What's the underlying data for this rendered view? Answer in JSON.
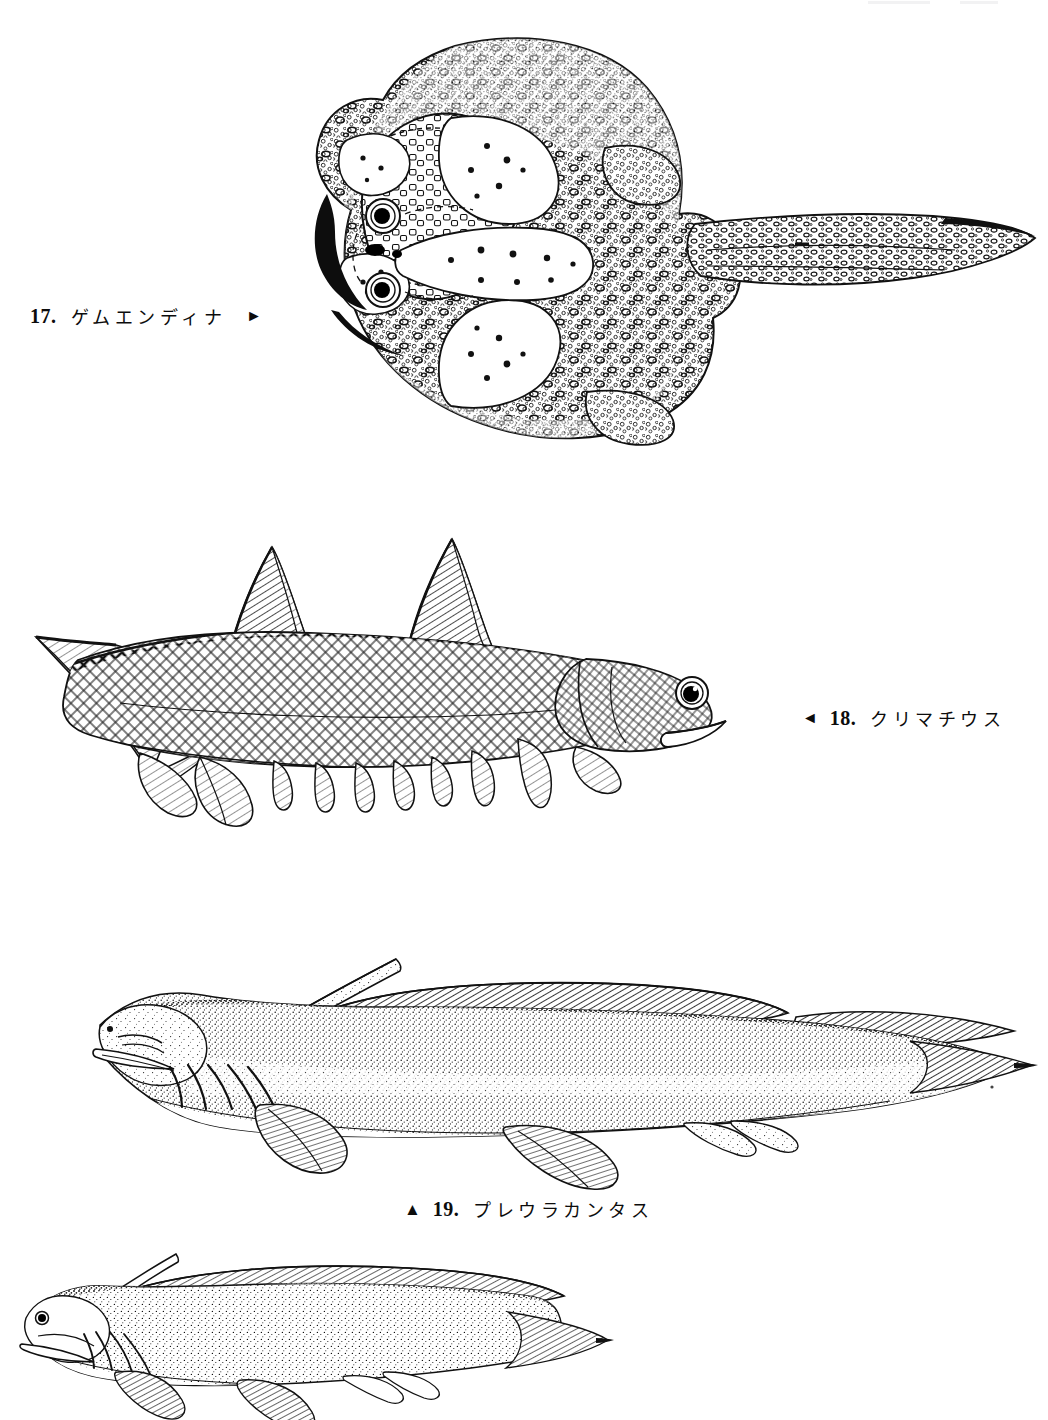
{
  "page": {
    "background_color": "#ffffff",
    "ink_color": "#111111",
    "width": 1048,
    "height": 1415,
    "medium": "pen-and-ink scientific illustration"
  },
  "figures": [
    {
      "id": "fig-17",
      "number": "17.",
      "name": "ゲムエンディナ",
      "arrow": "►",
      "arrow_direction": "right",
      "caption_side": "left",
      "subject": "Gemuendina - flattened ray-like placoderm, dorsal view with tuberculated armour, two dorsal eyes and long tapering tail"
    },
    {
      "id": "fig-18",
      "number": "18.",
      "name": "クリマチウス",
      "arrow": "◄",
      "arrow_direction": "left",
      "caption_side": "right",
      "subject": "Climatius - acanthodian 'spiny shark' in lateral view with two spined dorsal fins, heterocercal tail and a row of ventral spines"
    },
    {
      "id": "fig-19",
      "number": "19.",
      "name": "プレウラカンタス",
      "arrow": "▲",
      "arrow_direction": "up",
      "caption_side": "below",
      "subject": "Pleuracanthus - xenacanth shark in lateral view with long occipital spine, continuous dorsal fin and diphycercal pointed tail"
    },
    {
      "id": "fig-20",
      "number": "",
      "name": "",
      "arrow": "",
      "arrow_direction": "",
      "caption_side": "none",
      "subject": "unlabelled elongate shark-like fish, lower part cropped by the page edge"
    }
  ]
}
